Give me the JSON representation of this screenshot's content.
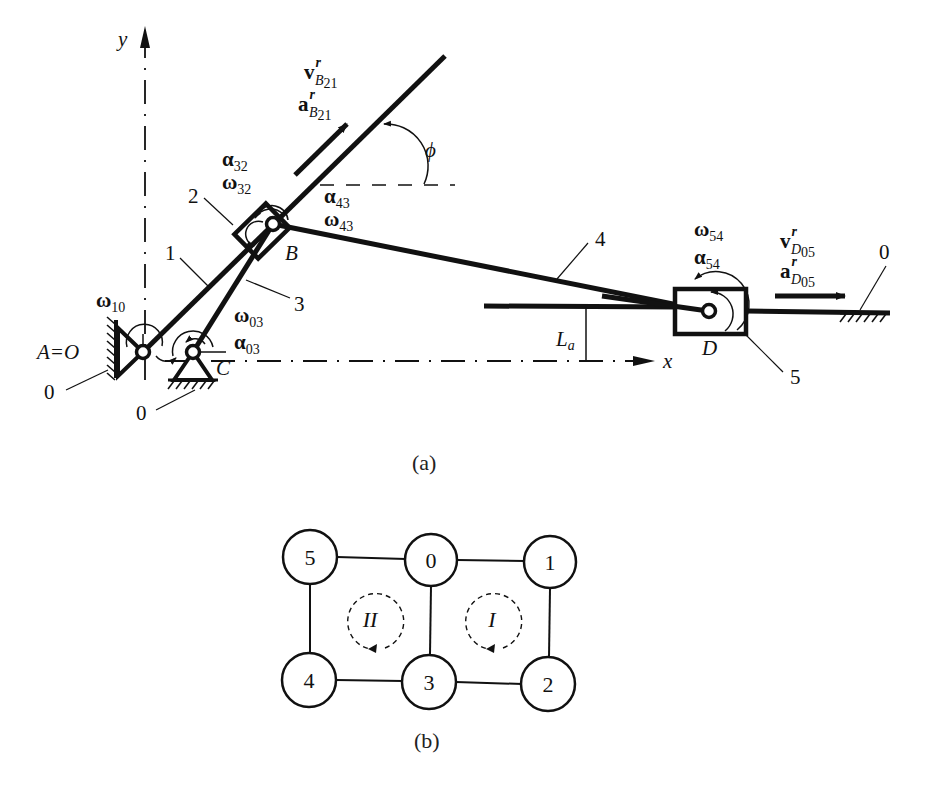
{
  "figure_a": {
    "caption": "(a)",
    "axes": {
      "x_label": "x",
      "y_label": "y"
    },
    "origin_label": "A=O",
    "points": {
      "B": "B",
      "C": "C",
      "D": "D"
    },
    "link_numbers": {
      "l0a": "0",
      "l0b": "0",
      "l0c": "0",
      "l1": "1",
      "l2": "2",
      "l3": "3",
      "l4": "4",
      "l5": "5"
    },
    "angle_label": "ϕ",
    "length_label": {
      "main": "L",
      "sub": "a"
    },
    "kinematics": {
      "omega10": {
        "sym": "ω",
        "sub": "10"
      },
      "omega03": {
        "sym": "ω",
        "sub": "03"
      },
      "alpha03": {
        "sym": "α",
        "sub": "03"
      },
      "alpha32": {
        "sym": "α",
        "sub": "32"
      },
      "omega32": {
        "sym": "ω",
        "sub": "32"
      },
      "alpha43": {
        "sym": "α",
        "sub": "43"
      },
      "omega43": {
        "sym": "ω",
        "sub": "43"
      },
      "omega54": {
        "sym": "ω",
        "sub": "54"
      },
      "alpha54": {
        "sym": "α",
        "sub": "54"
      },
      "vB21": {
        "sym": "v",
        "sup": "r",
        "sub": "B",
        "subsub": "21"
      },
      "aB21": {
        "sym": "a",
        "sup": "r",
        "sub": "B",
        "subsub": "21"
      },
      "vD05": {
        "sym": "v",
        "sup": "r",
        "sub": "D",
        "subsub": "05"
      },
      "aD05": {
        "sym": "a",
        "sup": "r",
        "sub": "D",
        "subsub": "05"
      }
    }
  },
  "figure_b": {
    "caption": "(b)",
    "nodes": [
      {
        "id": "5",
        "label": "5"
      },
      {
        "id": "0",
        "label": "0"
      },
      {
        "id": "1",
        "label": "1"
      },
      {
        "id": "4",
        "label": "4"
      },
      {
        "id": "3",
        "label": "3"
      },
      {
        "id": "2",
        "label": "2"
      }
    ],
    "edges": [
      [
        "5",
        "0"
      ],
      [
        "0",
        "1"
      ],
      [
        "5",
        "4"
      ],
      [
        "0",
        "3"
      ],
      [
        "1",
        "2"
      ],
      [
        "4",
        "3"
      ],
      [
        "3",
        "2"
      ]
    ],
    "loops": [
      {
        "id": "II",
        "label": "II"
      },
      {
        "id": "I",
        "label": "I"
      }
    ]
  }
}
